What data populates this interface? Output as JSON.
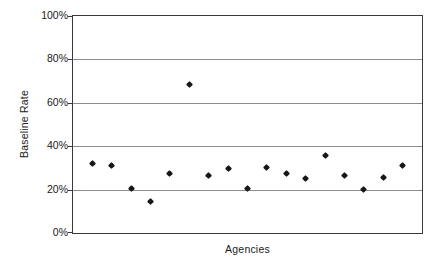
{
  "chart_data": {
    "type": "scatter",
    "title": "",
    "xlabel": "Agencies",
    "ylabel": "Baseline Rate",
    "ylim": [
      0,
      100
    ],
    "yticks": [
      0,
      20,
      40,
      60,
      80,
      100
    ],
    "ytick_labels": [
      "0%",
      "20%",
      "40%",
      "60%",
      "80%",
      "100%"
    ],
    "xticks": [],
    "xtick_labels": [],
    "grid": "horizontal",
    "legend": "none",
    "series": [
      {
        "name": "Baseline Rate",
        "marker": "diamond",
        "color": "#171717",
        "x": [
          1,
          2,
          3,
          4,
          5,
          6,
          7,
          8,
          9,
          10,
          11,
          12,
          13,
          14,
          15,
          16,
          17
        ],
        "values": [
          32,
          31,
          20.5,
          14.5,
          27.5,
          68.5,
          26.5,
          29.5,
          20.5,
          30,
          27.5,
          25,
          35.5,
          26.5,
          20,
          25.5,
          31
        ]
      }
    ]
  },
  "axes": {
    "y_title": "Baseline Rate",
    "x_title": "Agencies"
  }
}
